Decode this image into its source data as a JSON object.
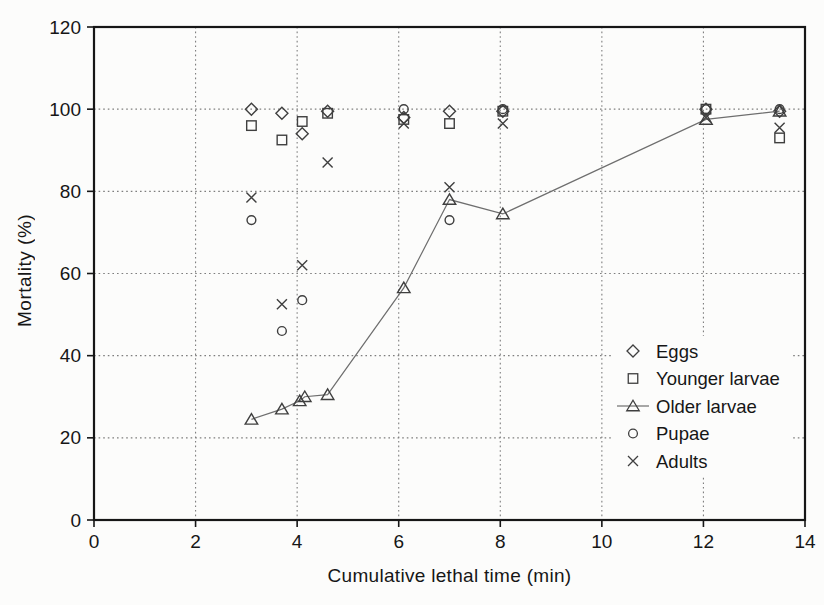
{
  "figure": {
    "kind": "scanned scatter/line chart, grayscale, no title"
  },
  "chart_data": {
    "type": "scatter",
    "title": "",
    "xlabel": "Cumulative lethal time (min)",
    "ylabel": "Mortality (%)",
    "xlim": [
      0,
      14
    ],
    "ylim": [
      0,
      120
    ],
    "xticks": [
      0,
      2,
      4,
      6,
      8,
      10,
      12,
      14
    ],
    "yticks": [
      0,
      20,
      40,
      60,
      80,
      100,
      120
    ],
    "grid": "fine dotted gridlines at every tick, both directions",
    "legend_position": "inside plot, center-right, white background, no border",
    "series": [
      {
        "name": "Eggs",
        "marker": "diamond",
        "line": false,
        "points": [
          [
            3.1,
            100
          ],
          [
            3.7,
            99
          ],
          [
            4.1,
            94
          ],
          [
            4.6,
            99.5
          ],
          [
            6.1,
            98
          ],
          [
            7,
            99.5
          ],
          [
            8.05,
            99.5
          ],
          [
            12.05,
            100
          ],
          [
            13.5,
            99.5
          ]
        ]
      },
      {
        "name": "Younger larvae",
        "marker": "square",
        "line": false,
        "points": [
          [
            3.1,
            96
          ],
          [
            3.7,
            92.5
          ],
          [
            4.1,
            97
          ],
          [
            4.6,
            99
          ],
          [
            6.1,
            97.5
          ],
          [
            7,
            96.5
          ],
          [
            8.05,
            99.5
          ],
          [
            12.05,
            100
          ],
          [
            13.5,
            93
          ]
        ]
      },
      {
        "name": "Older larvae",
        "marker": "triangle",
        "line": true,
        "points": [
          [
            3.1,
            24.5
          ],
          [
            3.7,
            27
          ],
          [
            4.05,
            29
          ],
          [
            4.15,
            30
          ],
          [
            4.6,
            30.5
          ],
          [
            6.1,
            56.5
          ],
          [
            7,
            78
          ],
          [
            8.05,
            74.5
          ],
          [
            12.05,
            97.5
          ],
          [
            13.5,
            99.5
          ]
        ]
      },
      {
        "name": "Pupae",
        "marker": "circle",
        "line": false,
        "points": [
          [
            3.1,
            73
          ],
          [
            3.7,
            46
          ],
          [
            4.1,
            53.5
          ],
          [
            6.1,
            100
          ],
          [
            7,
            73
          ],
          [
            8.05,
            100
          ],
          [
            12.05,
            100
          ],
          [
            13.5,
            100
          ]
        ]
      },
      {
        "name": "Adults",
        "marker": "x",
        "line": false,
        "points": [
          [
            3.1,
            78.5
          ],
          [
            3.7,
            52.5
          ],
          [
            4.1,
            62
          ],
          [
            4.6,
            87
          ],
          [
            6.1,
            96.5
          ],
          [
            7,
            81
          ],
          [
            8.05,
            96.5
          ],
          [
            12.05,
            98
          ],
          [
            13.5,
            95.5
          ]
        ]
      }
    ],
    "colors": {
      "marker": "#3f3f3f",
      "line": "#6e6e6e",
      "grid": "#7e7e7e",
      "frame": "#161616",
      "text": "#161616",
      "legend_bg": "#fcfcfb"
    }
  }
}
